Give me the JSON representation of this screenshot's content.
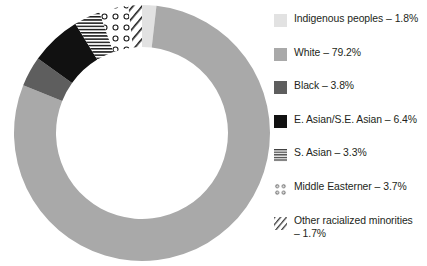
{
  "chart_data": {
    "type": "pie",
    "variant": "donut",
    "title": "",
    "subtitle": "",
    "xlabel": "",
    "ylabel": "",
    "units": "percent",
    "total": 100,
    "legend_position": "right",
    "grid": false,
    "start_angle_deg": 0,
    "direction": "clockwise",
    "categories": [
      "Indigenous peoples",
      "White",
      "Black",
      "E. Asian/S.E. Asian",
      "S. Asian",
      "Middle Easterner",
      "Other racialized minorities"
    ],
    "values": [
      1.8,
      79.2,
      3.8,
      6.4,
      3.3,
      3.7,
      1.7
    ],
    "value_labels": [
      "1.8%",
      "79.2%",
      "3.8%",
      "6.4%",
      "3.3%",
      "3.7%",
      "1.7%"
    ],
    "slices": [
      {
        "label": "Indigenous peoples",
        "value": 1.8,
        "value_label": "1.8%",
        "legend_text": "Indigenous peoples – 1.8%",
        "fill": "#e2e2e2",
        "pattern": "solid",
        "swatch_name": "swatch-indigenous-peoples"
      },
      {
        "label": "White",
        "value": 79.2,
        "value_label": "79.2%",
        "legend_text": "White – 79.2%",
        "fill": "#a9a9a9",
        "pattern": "solid",
        "swatch_name": "swatch-white"
      },
      {
        "label": "Black",
        "value": 3.8,
        "value_label": "3.8%",
        "legend_text": "Black – 3.8%",
        "fill": "#5e5e5e",
        "pattern": "solid",
        "swatch_name": "swatch-black"
      },
      {
        "label": "E. Asian/S.E. Asian",
        "value": 6.4,
        "value_label": "6.4%",
        "legend_text": "E. Asian/S.E. Asian – 6.4%",
        "fill": "#111111",
        "pattern": "solid",
        "swatch_name": "swatch-e-asian-se-asian"
      },
      {
        "label": "S. Asian",
        "value": 3.3,
        "value_label": "3.3%",
        "legend_text": "S. Asian – 3.3%",
        "fill": "#ffffff",
        "pattern": "horizontal-lines",
        "swatch_name": "swatch-s-asian"
      },
      {
        "label": "Middle Easterner",
        "value": 3.7,
        "value_label": "3.7%",
        "legend_text": "Middle Easterner – 3.7%",
        "fill": "#ffffff",
        "pattern": "dots-open-circles",
        "swatch_name": "swatch-middle-easterner"
      },
      {
        "label": "Other racialized minorities",
        "value": 1.7,
        "value_label": "1.7%",
        "legend_text": "Other racialized minorities\n– 1.7%",
        "fill": "#ffffff",
        "pattern": "diagonal-lines",
        "swatch_name": "swatch-other-racialized-minorities"
      }
    ],
    "colors": {
      "indigenous_peoples": "#e2e2e2",
      "white": "#a9a9a9",
      "black": "#5e5e5e",
      "e_asian_se_asian": "#111111",
      "pattern_stroke": "#1a1a1a",
      "text": "#231f20",
      "background": "#ffffff"
    }
  },
  "legend": {
    "items": [
      {
        "text": "Indigenous peoples – 1.8%"
      },
      {
        "text": "White – 79.2%"
      },
      {
        "text": "Black – 3.8%"
      },
      {
        "text": "E. Asian/S.E. Asian – 6.4%"
      },
      {
        "text": "S. Asian – 3.3%"
      },
      {
        "text": "Middle Easterner – 3.7%"
      },
      {
        "text": "Other racialized minorities\n– 1.7%"
      }
    ]
  }
}
